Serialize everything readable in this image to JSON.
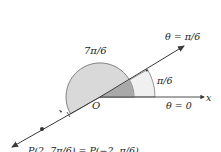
{
  "diagram": {
    "type": "polar-coordinates",
    "origin_label": "O",
    "axis_label": "x",
    "ray_label_top": "θ = π/6",
    "ray_label_axis": "θ = 0",
    "angle_small_label": "π/6",
    "angle_large_label": "7π/6",
    "point_label": "P(2, 7π/6) = P(−2, π/6)",
    "colors": {
      "line": "#3a3a3a",
      "large_sector": "#d9d9d9",
      "small_sector": "#a9a9a9",
      "outer_sector": "#f0f0f0",
      "point": "#333333"
    }
  }
}
